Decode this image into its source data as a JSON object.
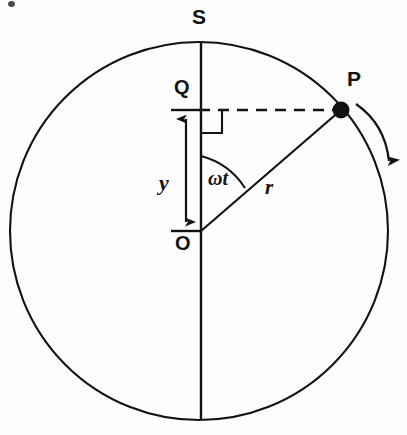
{
  "figure": {
    "background_color": "#fdfdfd",
    "ink_color": "#121212"
  },
  "labels": {
    "top_point": "S",
    "particle_point": "P",
    "projection_point": "Q",
    "centre_point": "O",
    "displacement": "y",
    "angle": "ωt",
    "radius": "r"
  },
  "geometry": {
    "circle": {
      "cx": 199,
      "cy": 231,
      "r": 189
    },
    "centre_O": {
      "x": 201,
      "y": 231
    },
    "top_S": {
      "x": 201,
      "y": 42
    },
    "bottom": {
      "x": 201,
      "y": 420
    },
    "particle_P": {
      "x": 341,
      "y": 110
    },
    "projection_Q": {
      "x": 201,
      "y": 110
    },
    "angle_wt_degrees": 36,
    "radius_length": 180,
    "displacement_y_length": 121
  },
  "elements": {
    "circle_outline": "solid",
    "vertical_diameter": "solid",
    "radius_line_OP": "solid",
    "perpendicular_PQ": "dashed",
    "right_angle_marker": "square",
    "angle_arc": "arc from vertical SO to radius OP",
    "displacement_arrow": "double-headed vertical arrow between O and Q",
    "rotation_arrow": "curved arrow outside circle near P, clockwise",
    "particle_marker": "filled-dot"
  },
  "ghost_text": {
    "line_1": "· · · · · ·",
    "line_2": "· · · · · · ·",
    "line_3": "· · · · ·",
    "line_4": "· · · ·"
  }
}
